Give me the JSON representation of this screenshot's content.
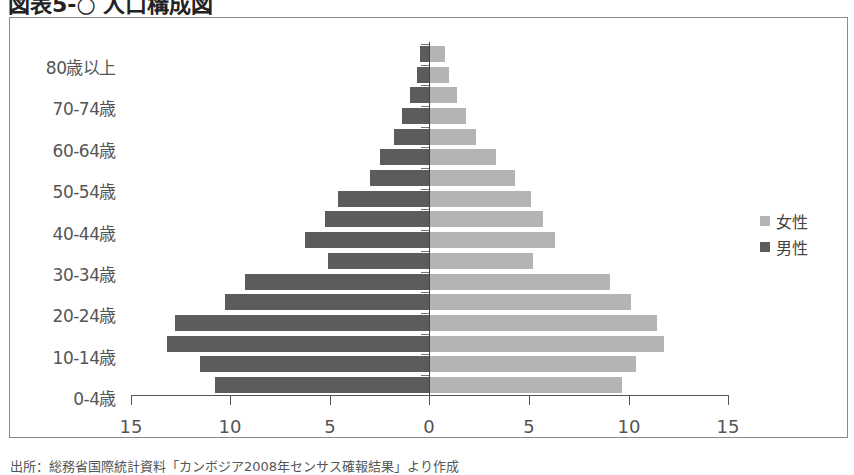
{
  "title": "図表5-○ 人口構成図",
  "footnote": "出所：総務省国際統計資料「カンボジア2008年センサス確報結果」より作成",
  "legend": [
    {
      "label": "女性",
      "color": "#b4b4b4"
    },
    {
      "label": "男性",
      "color": "#5c5c5c"
    }
  ],
  "y_labels_shown": [
    "80歳以上",
    "70-74歳",
    "60-64歳",
    "50-54歳",
    "40-44歳",
    "30-34歳",
    "20-24歳",
    "10-14歳",
    "0-4歳"
  ],
  "x_ticks": [
    "15",
    "10",
    "5",
    "0",
    "5",
    "10",
    "15"
  ],
  "chart_data": {
    "type": "bar",
    "orientation": "horizontal",
    "subtype": "population-pyramid",
    "title": "人口構成図",
    "xlabel": "",
    "ylabel": "",
    "xlim": [
      -15,
      15
    ],
    "x_tick_labels": [
      "15",
      "10",
      "5",
      "0",
      "5",
      "10",
      "15"
    ],
    "categories": [
      "0-4歳",
      "5-9歳",
      "10-14歳",
      "15-19歳",
      "20-24歳",
      "25-29歳",
      "30-34歳",
      "35-39歳",
      "40-44歳",
      "45-49歳",
      "50-54歳",
      "55-59歳",
      "60-64歳",
      "65-69歳",
      "70-74歳",
      "75-79歳",
      "80歳以上"
    ],
    "series": [
      {
        "name": "男性",
        "color": "#5c5c5c",
        "side": "left",
        "values": [
          10.75,
          11.5,
          13.15,
          12.75,
          10.25,
          9.25,
          5.1,
          6.25,
          5.25,
          4.55,
          2.95,
          2.45,
          1.75,
          1.35,
          0.95,
          0.6,
          0.45
        ]
      },
      {
        "name": "女性",
        "color": "#b4b4b4",
        "side": "right",
        "values": [
          9.65,
          10.35,
          11.75,
          11.4,
          10.1,
          9.05,
          5.2,
          6.3,
          5.7,
          5.1,
          4.25,
          3.3,
          2.3,
          1.8,
          1.35,
          0.95,
          0.75
        ]
      }
    ],
    "legend_position": "right",
    "grid": false
  }
}
